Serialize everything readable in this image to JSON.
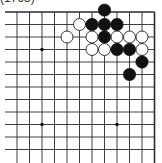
{
  "caption": "(1765)",
  "board": {
    "region": "top-right corner of 19x19 Go board",
    "spacing": 12.5,
    "origin_x": 17,
    "origin_y": 12,
    "cols": 12,
    "rows": 12,
    "edge_top": true,
    "edge_right": true,
    "line_color": "#2a2a2a",
    "star_points": [
      [
        2,
        3
      ],
      [
        8,
        9
      ],
      [
        2,
        9
      ]
    ],
    "stones": [
      {
        "color": "black",
        "col": 7,
        "row": -0.15
      },
      {
        "color": "white",
        "col": 5,
        "row": 1
      },
      {
        "color": "black",
        "col": 6,
        "row": 1
      },
      {
        "color": "black",
        "col": 7,
        "row": 1
      },
      {
        "color": "black",
        "col": 8,
        "row": 1
      },
      {
        "color": "white",
        "col": 4,
        "row": 2
      },
      {
        "color": "white",
        "col": 6,
        "row": 2
      },
      {
        "color": "black",
        "col": 7,
        "row": 2
      },
      {
        "color": "white",
        "col": 8,
        "row": 2
      },
      {
        "color": "white",
        "col": 9,
        "row": 2
      },
      {
        "color": "white",
        "col": 10,
        "row": 2
      },
      {
        "color": "white",
        "col": 6,
        "row": 3
      },
      {
        "color": "white",
        "col": 7,
        "row": 3
      },
      {
        "color": "black",
        "col": 8,
        "row": 3
      },
      {
        "color": "black",
        "col": 9,
        "row": 3
      },
      {
        "color": "white",
        "col": 10,
        "row": 3
      },
      {
        "color": "black",
        "col": 10,
        "row": 4
      },
      {
        "color": "black",
        "col": 9,
        "row": 5
      }
    ]
  }
}
